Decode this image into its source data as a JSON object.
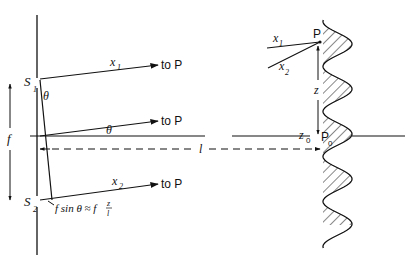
{
  "diagram": {
    "left": {
      "slit_labels": {
        "s1_main": "S",
        "s1_sub": "1",
        "s2_main": "S",
        "s2_sub": "2"
      },
      "separation_label": "f",
      "angle_label_near_slit": "θ",
      "angle_label_axis": "θ",
      "rays": [
        {
          "label_main": "x",
          "label_sub": "1",
          "target": "to P"
        },
        {
          "label_main": "",
          "label_sub": "",
          "target": "to P"
        },
        {
          "label_main": "x",
          "label_sub": "2",
          "target": "to P"
        }
      ],
      "path_difference": {
        "prefix": "f sin θ ≈ f",
        "fraction_num": "z",
        "fraction_den": "l"
      },
      "distance_label": "l"
    },
    "right": {
      "point_P": "P",
      "point_P0_main": "P",
      "point_P0_sub": "0",
      "incoming_ray_labels": [
        {
          "main": "x",
          "sub": "1"
        },
        {
          "main": "x",
          "sub": "2"
        }
      ],
      "displacement_label": "z",
      "origin_label_main": "z",
      "origin_label_sub": "0",
      "fringe_pattern": "cos² intensity pattern, hatched"
    }
  }
}
